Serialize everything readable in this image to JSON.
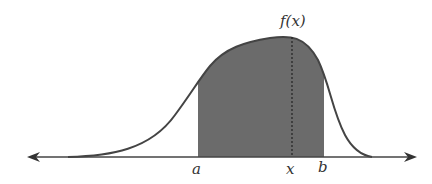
{
  "diagram": {
    "curve_label": "f(x)",
    "axis_labels": {
      "a": "a",
      "x": "x",
      "b": "b"
    },
    "colors": {
      "curve": "#444444",
      "fill": "#6b6b6b",
      "axis": "#444444",
      "background": "#ffffff"
    }
  }
}
